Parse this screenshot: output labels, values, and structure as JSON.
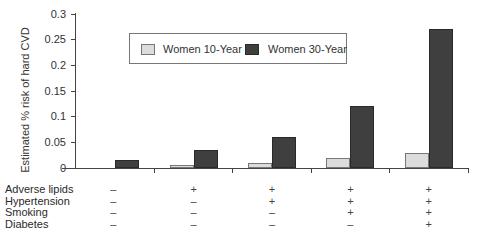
{
  "chart_data": {
    "type": "bar",
    "title": "",
    "xlabel": "",
    "ylabel": "Estimated % risk of hard CVD",
    "ylim": [
      0,
      0.3
    ],
    "yticks": [
      "0",
      "0.05",
      "0.1",
      "0.15",
      "0.2",
      "0.25",
      "0.3"
    ],
    "grid": false,
    "legend_position": "top-inside",
    "categories": [
      "No risk factors",
      "Adverse lipids",
      "Adverse lipids + Hypertension",
      "Adverse lipids + Hypertension + Smoking",
      "Adverse lipids + Hypertension + Smoking + Diabetes"
    ],
    "series": [
      {
        "name": "Women 10-Year",
        "color": "#dcdcdc",
        "values": [
          0.0,
          0.005,
          0.01,
          0.02,
          0.03
        ]
      },
      {
        "name": "Women 30-Year",
        "color": "#3f3f3f",
        "values": [
          0.015,
          0.035,
          0.06,
          0.12,
          0.27
        ]
      }
    ],
    "risk_factor_table": {
      "rows": [
        {
          "label": "Adverse lipids",
          "values": [
            "–",
            "+",
            "+",
            "+",
            "+"
          ]
        },
        {
          "label": "Hypertension",
          "values": [
            "–",
            "–",
            "+",
            "+",
            "+"
          ]
        },
        {
          "label": "Smoking",
          "values": [
            "–",
            "–",
            "–",
            "+",
            "+"
          ]
        },
        {
          "label": "Diabetes",
          "values": [
            "–",
            "–",
            "–",
            "–",
            "+"
          ]
        }
      ]
    }
  },
  "legend": {
    "items": [
      {
        "label": "Women 10-Year"
      },
      {
        "label": "Women 30-Year"
      }
    ]
  },
  "axis": {
    "ylabel": "Estimated % risk of hard CVD",
    "yticks": [
      "0.3",
      "0.25",
      "0.2",
      "0.15",
      "0.1",
      "0.05",
      "0"
    ]
  },
  "table": {
    "labels": [
      "Adverse lipids",
      "Hypertension",
      "Smoking",
      "Diabetes"
    ],
    "signs": [
      [
        "–",
        "+",
        "+",
        "+",
        "+"
      ],
      [
        "–",
        "–",
        "+",
        "+",
        "+"
      ],
      [
        "–",
        "–",
        "–",
        "+",
        "+"
      ],
      [
        "–",
        "–",
        "–",
        "–",
        "+"
      ]
    ]
  }
}
